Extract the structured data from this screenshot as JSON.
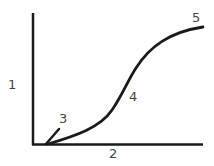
{
  "diagram": {
    "type": "s-curve-growth-diagram",
    "labels": {
      "y_axis": "1",
      "x_axis": "2",
      "initial_segment": "3",
      "inflection": "4",
      "plateau": "5"
    },
    "colors": {
      "stroke": "#1a1a1a",
      "text": "#444444",
      "background": "#ffffff"
    }
  }
}
